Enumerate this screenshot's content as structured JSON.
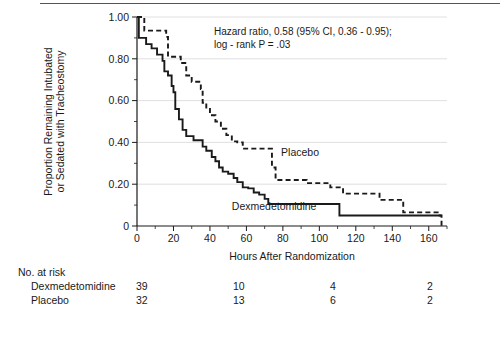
{
  "chart_data": {
    "type": "line",
    "title": "",
    "xlabel": "Hours After Randomization",
    "ylabel_line1": "Proportion Remaining Intubated",
    "ylabel_line2": "or Sedated with Tracheostomy",
    "xlim": [
      0,
      170
    ],
    "ylim": [
      0,
      1.0
    ],
    "xticks": [
      0,
      20,
      40,
      60,
      80,
      100,
      120,
      140,
      160
    ],
    "xtick_labels": [
      "0",
      "20",
      "40",
      "60",
      "80",
      "100",
      "120",
      "140",
      "160"
    ],
    "xtick_minor_step": 10,
    "yticks": [
      0,
      0.2,
      0.4,
      0.6,
      0.8,
      1.0
    ],
    "ytick_labels": [
      "0",
      "0.20",
      "0.40",
      "0.60",
      "0.80",
      "1.00"
    ],
    "ytick_minor_step": 0.1,
    "grid": "horizontal",
    "legend_position": "inline-annotations",
    "annotation_line1": "Hazard ratio, 0.58 (95% CI, 0.36 - 0.95);",
    "annotation_line2": "log - rank P = .03",
    "series": [
      {
        "name": "Dexmedetomidine",
        "style": "solid",
        "color": "#1a1a1a",
        "label_x": 52,
        "label_y": 0.075,
        "points": [
          [
            0,
            1.0
          ],
          [
            1,
            0.9
          ],
          [
            5,
            0.87
          ],
          [
            8,
            0.85
          ],
          [
            11,
            0.82
          ],
          [
            14,
            0.79
          ],
          [
            15,
            0.74
          ],
          [
            17,
            0.72
          ],
          [
            19,
            0.67
          ],
          [
            20,
            0.64
          ],
          [
            21,
            0.56
          ],
          [
            23,
            0.51
          ],
          [
            25,
            0.46
          ],
          [
            27,
            0.43
          ],
          [
            31,
            0.41
          ],
          [
            34,
            0.41
          ],
          [
            36,
            0.38
          ],
          [
            38,
            0.36
          ],
          [
            41,
            0.33
          ],
          [
            43,
            0.31
          ],
          [
            45,
            0.28
          ],
          [
            47,
            0.26
          ],
          [
            50,
            0.25
          ],
          [
            53,
            0.23
          ],
          [
            55,
            0.21
          ],
          [
            58,
            0.185
          ],
          [
            61,
            0.18
          ],
          [
            64,
            0.16
          ],
          [
            67,
            0.15
          ],
          [
            70,
            0.13
          ],
          [
            72,
            0.105
          ],
          [
            110,
            0.105
          ],
          [
            111,
            0.05
          ],
          [
            165,
            0.05
          ],
          [
            167,
            0.05
          ]
        ]
      },
      {
        "name": "Placebo",
        "style": "dashed",
        "color": "#1a1a1a",
        "label_x": 79,
        "label_y": 0.335,
        "points": [
          [
            0,
            1.0
          ],
          [
            3,
            1.0
          ],
          [
            4,
            0.935
          ],
          [
            14,
            0.935
          ],
          [
            16,
            0.905
          ],
          [
            17,
            0.81
          ],
          [
            22,
            0.81
          ],
          [
            24,
            0.78
          ],
          [
            27,
            0.72
          ],
          [
            30,
            0.69
          ],
          [
            33,
            0.69
          ],
          [
            35,
            0.655
          ],
          [
            36,
            0.59
          ],
          [
            38,
            0.56
          ],
          [
            40,
            0.53
          ],
          [
            43,
            0.5
          ],
          [
            46,
            0.465
          ],
          [
            49,
            0.435
          ],
          [
            52,
            0.405
          ],
          [
            55,
            0.4
          ],
          [
            58,
            0.37
          ],
          [
            72,
            0.37
          ],
          [
            74,
            0.28
          ],
          [
            76,
            0.22
          ],
          [
            91,
            0.22
          ],
          [
            93,
            0.205
          ],
          [
            104,
            0.205
          ],
          [
            106,
            0.185
          ],
          [
            112,
            0.185
          ],
          [
            113,
            0.155
          ],
          [
            131,
            0.155
          ],
          [
            133,
            0.125
          ],
          [
            144,
            0.125
          ],
          [
            146,
            0.065
          ],
          [
            164,
            0.065
          ],
          [
            166,
            0.05
          ],
          [
            167,
            0.0
          ]
        ]
      }
    ],
    "risk_table": {
      "title": "No. at risk",
      "time_points": [
        0,
        50,
        100,
        150
      ],
      "rows": [
        {
          "label": "Dexmedetomidine",
          "values": [
            "39",
            "10",
            "4",
            "2"
          ]
        },
        {
          "label": "Placebo",
          "values": [
            "32",
            "13",
            "6",
            "2"
          ]
        }
      ]
    }
  }
}
